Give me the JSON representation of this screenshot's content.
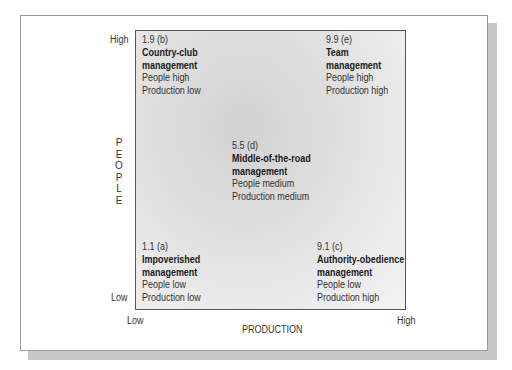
{
  "diagram": {
    "y_axis": {
      "label_letters": [
        "P",
        "E",
        "O",
        "P",
        "L",
        "E"
      ],
      "label": "PEOPLE",
      "high": "High",
      "low": "Low"
    },
    "x_axis": {
      "label": "PRODUCTION",
      "low": "Low",
      "high": "High"
    },
    "cells": {
      "b": {
        "score": "1.9 (b)",
        "name_line1": "Country-club",
        "name_line2": "management",
        "people": "People high",
        "production": "Production low"
      },
      "e": {
        "score": "9.9 (e)",
        "name_line1": "Team",
        "name_line2": "management",
        "people": "People high",
        "production": "Production high"
      },
      "d": {
        "score": "5.5 (d)",
        "name_line1": "Middle-of-the-road",
        "name_line2": "management",
        "people": "People medium",
        "production": "Production medium"
      },
      "a": {
        "score": "1.1 (a)",
        "name_line1": "Impoverished",
        "name_line2": "management",
        "people": "People low",
        "production": "Production low"
      },
      "c": {
        "score": "9.1 (c)",
        "name_line1": "Authority-obedience",
        "name_line2": "management",
        "people": "People low",
        "production": "Production high"
      }
    }
  }
}
